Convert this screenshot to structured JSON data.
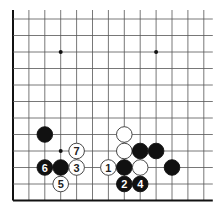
{
  "diagram": {
    "type": "go-board-fragment",
    "grid": {
      "columns": 13,
      "rows": 12,
      "origin_x": 13,
      "origin_y": 19,
      "spacing_x": 15.9,
      "spacing_y": 16.5,
      "open_top": true,
      "open_right": true,
      "line_color": "#555555",
      "edge_color": "#111111"
    },
    "star_points": [
      {
        "col": 3,
        "row": 2
      },
      {
        "col": 9,
        "row": 2
      },
      {
        "col": 3,
        "row": 8
      }
    ],
    "stones": [
      {
        "color": "black",
        "col": 2,
        "row": 7,
        "label": ""
      },
      {
        "color": "white",
        "col": 4,
        "row": 8,
        "label": "7"
      },
      {
        "color": "black",
        "col": 2,
        "row": 9,
        "label": "6"
      },
      {
        "color": "black",
        "col": 3,
        "row": 9,
        "label": ""
      },
      {
        "color": "white",
        "col": 4,
        "row": 9,
        "label": "3"
      },
      {
        "color": "white",
        "col": 3,
        "row": 10,
        "label": "5"
      },
      {
        "color": "white",
        "col": 7,
        "row": 7,
        "label": ""
      },
      {
        "color": "white",
        "col": 7,
        "row": 8,
        "label": ""
      },
      {
        "color": "black",
        "col": 8,
        "row": 8,
        "label": ""
      },
      {
        "color": "black",
        "col": 9,
        "row": 8,
        "label": ""
      },
      {
        "color": "white",
        "col": 6,
        "row": 9,
        "label": "1"
      },
      {
        "color": "black",
        "col": 7,
        "row": 9,
        "label": ""
      },
      {
        "color": "white",
        "col": 8,
        "row": 9,
        "label": ""
      },
      {
        "color": "black",
        "col": 10,
        "row": 9,
        "label": ""
      },
      {
        "color": "black",
        "col": 7,
        "row": 10,
        "label": "2"
      },
      {
        "color": "black",
        "col": 8,
        "row": 10,
        "label": "4"
      }
    ],
    "colors": {
      "black_stone": "#111111",
      "white_stone": "#ffffff",
      "white_stroke": "#333333",
      "black_label": "#ffffff",
      "white_label": "#222222"
    }
  }
}
